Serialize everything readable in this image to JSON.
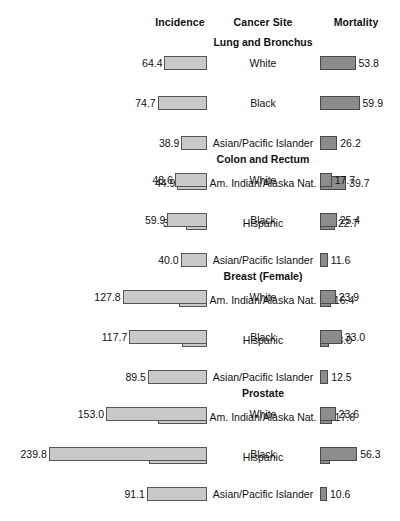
{
  "header": {
    "incidence_label": "Incidence",
    "site_label": "Cancer Site",
    "mortality_label": "Mortality"
  },
  "caption": "",
  "colors": {
    "incidence_fill": "#c9c9c9",
    "incidence_border": "#555555",
    "mortality_fill": "#8c8c8c",
    "mortality_border": "#4a4a4a",
    "text": "#111111",
    "background": "#ffffff"
  },
  "chart_data": {
    "type": "bar",
    "title": "",
    "xlabel": "",
    "ylabel": "",
    "orientation": "horizontal",
    "layout": "bidirectional-population-pyramid",
    "grid": false,
    "legend_position": "none",
    "scale_px_per_unit": 0.66,
    "series": [
      {
        "name": "Incidence",
        "direction": "left",
        "color": "#c9c9c9"
      },
      {
        "name": "Mortality",
        "direction": "right",
        "color": "#8c8c8c"
      }
    ],
    "categories": [
      "White",
      "Black",
      "Asian/Pacific Islander",
      "Am. Indian/Alaska Nat.",
      "Hispanic"
    ],
    "sections": [
      {
        "title": "Lung and Bronchus",
        "rows": [
          {
            "label": "White",
            "incidence": 64.4,
            "mortality": 53.8
          },
          {
            "label": "Black",
            "incidence": 74.7,
            "mortality": 59.9
          },
          {
            "label": "Asian/Pacific Islander",
            "incidence": 38.9,
            "mortality": 26.2
          },
          {
            "label": "Am. Indian/Alaska Nat.",
            "incidence": 44.9,
            "mortality": 39.7
          },
          {
            "label": "Hispanic",
            "incidence": 32.5,
            "mortality": 22.7
          }
        ]
      },
      {
        "title": "Colon and Rectum",
        "rows": [
          {
            "label": "White",
            "incidence": 48.6,
            "mortality": 17.7
          },
          {
            "label": "Black",
            "incidence": 59.9,
            "mortality": 25.4
          },
          {
            "label": "Asian/Pacific Islander",
            "incidence": 40.0,
            "mortality": 11.6
          },
          {
            "label": "Am. Indian/Alaska Nat.",
            "incidence": 42.3,
            "mortality": 16.4
          },
          {
            "label": "Hispanic",
            "incidence": 38.4,
            "mortality": 13.0
          }
        ]
      },
      {
        "title": "Breast (Female)",
        "rows": [
          {
            "label": "White",
            "incidence": 127.8,
            "mortality": 23.9
          },
          {
            "label": "Black",
            "incidence": 117.7,
            "mortality": 33.0
          },
          {
            "label": "Asian/Pacific Islander",
            "incidence": 89.5,
            "mortality": 12.5
          },
          {
            "label": "Am. Indian/Alaska Nat.",
            "incidence": 74.4,
            "mortality": 17.6
          },
          {
            "label": "Hispanic",
            "incidence": 88.3,
            "mortality": 15.5
          }
        ]
      },
      {
        "title": "Prostate",
        "rows": [
          {
            "label": "White",
            "incidence": 153.0,
            "mortality": 23.6
          },
          {
            "label": "Black",
            "incidence": 239.8,
            "mortality": 56.3
          },
          {
            "label": "Asian/Pacific Islander",
            "incidence": 91.1,
            "mortality": 10.6
          },
          {
            "label": "Am. Indian/Alaska Nat.",
            "incidence": 76.1,
            "mortality": 20.0
          },
          {
            "label": "Hispanic",
            "incidence": 133.4,
            "mortality": 19.6
          }
        ]
      }
    ]
  }
}
